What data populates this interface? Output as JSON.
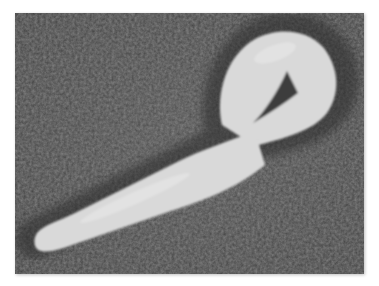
{
  "image": {
    "subject": "Filamentous virus particle with shepherd's-crook loop (electron micrograph)",
    "background_color": "#4b4b4b",
    "particle_color": "#d9d9d9",
    "frame_color": "#ffffff"
  }
}
